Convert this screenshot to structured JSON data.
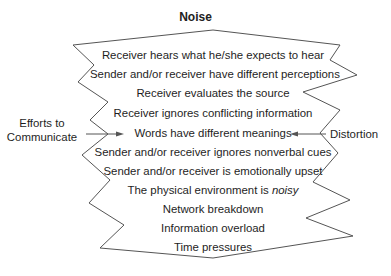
{
  "diagram": {
    "title": "Noise",
    "left_label": {
      "line1": "Efforts to",
      "line2": "Communicate"
    },
    "right_label": "Distortion",
    "items": [
      {
        "text": "Receiver hears what he/she expects to hear"
      },
      {
        "text": "Sender and/or receiver have different perceptions"
      },
      {
        "text": "Receiver evaluates the source"
      },
      {
        "text": "Receiver ignores conflicting information"
      },
      {
        "text": "Words have different meanings"
      },
      {
        "text": "Sender and/or receiver ignores nonverbal cues"
      },
      {
        "text": "Sender and/or receiver is emotionally upset"
      },
      {
        "text_prefix": "The physical environment is ",
        "text_emphasis": "noisy"
      },
      {
        "text": "Network breakdown"
      },
      {
        "text": "Information overload"
      },
      {
        "text": "Time pressures"
      }
    ],
    "colors": {
      "outline": "#555555",
      "text": "#1e1e1e",
      "background": "#ffffff"
    }
  }
}
